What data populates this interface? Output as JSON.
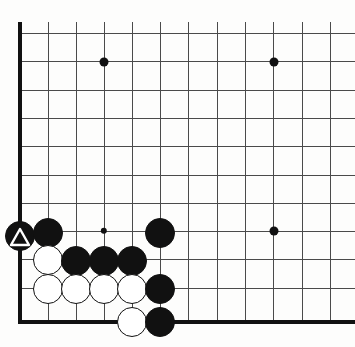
{
  "figure": {
    "kind": "go-board-diagram",
    "corner": "bottom-left",
    "width_px": 355,
    "height_px": 347,
    "colors": {
      "background": "#fdfdfc",
      "grid": "#4a4a4a",
      "edge": "#111111",
      "black_stone": "#111111",
      "white_stone": "#ffffff",
      "mark": "#ffffff"
    }
  },
  "board": {
    "origin_x": 20,
    "origin_y": 322,
    "spacing": 28.4,
    "stone_diameter": 30,
    "columns_px": [
      20,
      48,
      76,
      104,
      132,
      160,
      188,
      217,
      245,
      273,
      302,
      330,
      355
    ],
    "rows_px": [
      33,
      61,
      90,
      118,
      146,
      175,
      203,
      231,
      259,
      288,
      322
    ],
    "grid_lines_h_px": [
      33,
      61,
      90,
      118,
      146,
      175,
      203,
      231,
      259,
      288
    ],
    "grid_lines_v_px": [
      48,
      76,
      104,
      132,
      160,
      188,
      217,
      245,
      273,
      302,
      330
    ],
    "edges": {
      "left_x": 20,
      "left_y1": 22,
      "left_y2": 324,
      "bottom_y": 322,
      "bottom_x1": 18,
      "bottom_x2": 355
    }
  },
  "star_points": [
    {
      "name": "star-point-upper-left",
      "x": 104,
      "y": 62,
      "r": 4.5
    },
    {
      "name": "star-point-upper-right",
      "x": 274,
      "y": 62,
      "r": 4.5
    },
    {
      "name": "star-point-lower-right",
      "x": 274,
      "y": 231,
      "r": 4.5
    },
    {
      "name": "star-point-lower-left",
      "x": 104,
      "y": 231,
      "r": 3.2
    }
  ],
  "stones": [
    {
      "name": "black-stone-marked",
      "color": "black",
      "x": 20,
      "y": 236,
      "mark": "triangle"
    },
    {
      "name": "black-stone-b2",
      "color": "black",
      "x": 48,
      "y": 233,
      "mark": ""
    },
    {
      "name": "black-stone-b3",
      "color": "black",
      "x": 160,
      "y": 233,
      "mark": ""
    },
    {
      "name": "white-stone-w1",
      "color": "white",
      "x": 48,
      "y": 260,
      "mark": ""
    },
    {
      "name": "black-stone-b4",
      "color": "black",
      "x": 76,
      "y": 261,
      "mark": ""
    },
    {
      "name": "black-stone-b5",
      "color": "black",
      "x": 104,
      "y": 261,
      "mark": ""
    },
    {
      "name": "black-stone-b6",
      "color": "black",
      "x": 132,
      "y": 261,
      "mark": ""
    },
    {
      "name": "white-stone-w2",
      "color": "white",
      "x": 48,
      "y": 289,
      "mark": ""
    },
    {
      "name": "white-stone-w3",
      "color": "white",
      "x": 76,
      "y": 289,
      "mark": ""
    },
    {
      "name": "white-stone-w4",
      "color": "white",
      "x": 104,
      "y": 289,
      "mark": ""
    },
    {
      "name": "white-stone-w5",
      "color": "white",
      "x": 132,
      "y": 289,
      "mark": ""
    },
    {
      "name": "black-stone-b7",
      "color": "black",
      "x": 160,
      "y": 289,
      "mark": ""
    },
    {
      "name": "white-stone-w6",
      "color": "white",
      "x": 132,
      "y": 322,
      "mark": ""
    },
    {
      "name": "black-stone-b8",
      "color": "black",
      "x": 160,
      "y": 322,
      "mark": ""
    }
  ]
}
